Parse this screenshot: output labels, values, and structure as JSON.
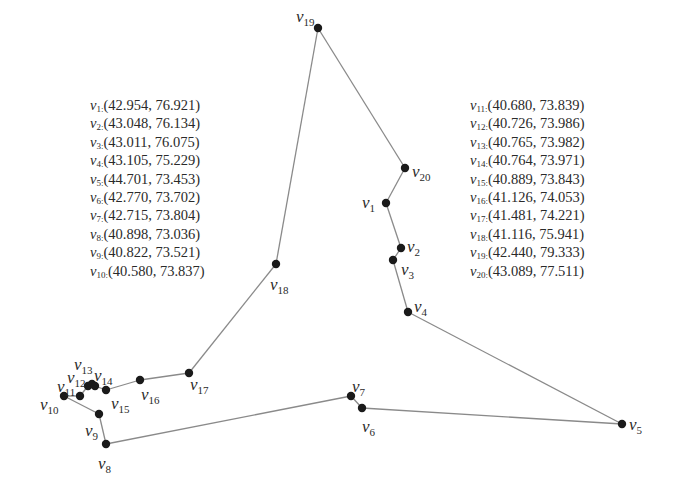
{
  "diagram": {
    "type": "tour-graph",
    "edge_color": "#8a8a8a",
    "node_color": "#1a1a1a",
    "tour_order": [
      "v1",
      "v2",
      "v3",
      "v4",
      "v5",
      "v6",
      "v7",
      "v8",
      "v9",
      "v10",
      "v11",
      "v12",
      "v13",
      "v14",
      "v15",
      "v16",
      "v17",
      "v18",
      "v19",
      "v20",
      "v1"
    ]
  },
  "nodes": [
    {
      "id": "v1",
      "name": "v",
      "sub": "1",
      "x": 386,
      "y": 203,
      "lx": 362,
      "ly": 208
    },
    {
      "id": "v2",
      "name": "v",
      "sub": "2",
      "x": 401,
      "y": 248,
      "lx": 407,
      "ly": 252
    },
    {
      "id": "v3",
      "name": "v",
      "sub": "3",
      "x": 393,
      "y": 260,
      "lx": 401,
      "ly": 275
    },
    {
      "id": "v4",
      "name": "v",
      "sub": "4",
      "x": 408,
      "y": 312,
      "lx": 414,
      "ly": 312
    },
    {
      "id": "v5",
      "name": "v",
      "sub": "5",
      "x": 622,
      "y": 424,
      "lx": 629,
      "ly": 430
    },
    {
      "id": "v6",
      "name": "v",
      "sub": "6",
      "x": 362,
      "y": 408,
      "lx": 362,
      "ly": 432
    },
    {
      "id": "v7",
      "name": "v",
      "sub": "7",
      "x": 351,
      "y": 396,
      "lx": 352,
      "ly": 392
    },
    {
      "id": "v8",
      "name": "v",
      "sub": "8",
      "x": 106,
      "y": 444,
      "lx": 98,
      "ly": 469
    },
    {
      "id": "v9",
      "name": "v",
      "sub": "9",
      "x": 99,
      "y": 414,
      "lx": 85,
      "ly": 436
    },
    {
      "id": "v10",
      "name": "v",
      "sub": "10",
      "x": 64,
      "y": 396,
      "lx": 40,
      "ly": 410
    },
    {
      "id": "v11",
      "name": "v",
      "sub": "11",
      "x": 80,
      "y": 396,
      "lx": 57,
      "ly": 392
    },
    {
      "id": "v12",
      "name": "v",
      "sub": "12",
      "x": 88,
      "y": 386,
      "lx": 67,
      "ly": 383
    },
    {
      "id": "v13",
      "name": "v",
      "sub": "13",
      "x": 92,
      "y": 384,
      "lx": 74,
      "ly": 370
    },
    {
      "id": "v14",
      "name": "v",
      "sub": "14",
      "x": 95,
      "y": 386,
      "lx": 94,
      "ly": 381
    },
    {
      "id": "v15",
      "name": "v",
      "sub": "15",
      "x": 106,
      "y": 390,
      "lx": 111,
      "ly": 409
    },
    {
      "id": "v16",
      "name": "v",
      "sub": "16",
      "x": 140,
      "y": 380,
      "lx": 141,
      "ly": 400
    },
    {
      "id": "v17",
      "name": "v",
      "sub": "17",
      "x": 189,
      "y": 373,
      "lx": 190,
      "ly": 390
    },
    {
      "id": "v18",
      "name": "v",
      "sub": "18",
      "x": 276,
      "y": 264,
      "lx": 270,
      "ly": 290
    },
    {
      "id": "v19",
      "name": "v",
      "sub": "19",
      "x": 318,
      "y": 28,
      "lx": 296,
      "ly": 22
    },
    {
      "id": "v20",
      "name": "v",
      "sub": "20",
      "x": 405,
      "y": 168,
      "lx": 412,
      "ly": 177
    }
  ],
  "coordinate_lists": {
    "left": [
      {
        "name": "v",
        "sub": "1:",
        "value": "(42.954, 76.921)"
      },
      {
        "name": "v",
        "sub": "2:",
        "value": "(43.048, 76.134)"
      },
      {
        "name": "v",
        "sub": "3:",
        "value": "(43.011, 76.075)"
      },
      {
        "name": "v",
        "sub": "4:",
        "value": "(43.105, 75.229)"
      },
      {
        "name": "v",
        "sub": "5:",
        "value": "(44.701, 73.453)"
      },
      {
        "name": "v",
        "sub": "6:",
        "value": "(42.770, 73.702)"
      },
      {
        "name": "v",
        "sub": "7:",
        "value": "(42.715, 73.804)"
      },
      {
        "name": "v",
        "sub": "8:",
        "value": "(40.898, 73.036)"
      },
      {
        "name": "v",
        "sub": "9:",
        "value": "(40.822, 73.521)"
      },
      {
        "name": "v",
        "sub": "10:",
        "value": "(40.580, 73.837)"
      }
    ],
    "right": [
      {
        "name": "v",
        "sub": "11:",
        "value": "(40.680, 73.839)"
      },
      {
        "name": "v",
        "sub": "12:",
        "value": "(40.726, 73.986)"
      },
      {
        "name": "v",
        "sub": "13:",
        "value": "(40.765, 73.982)"
      },
      {
        "name": "v",
        "sub": "14:",
        "value": "(40.764, 73.971)"
      },
      {
        "name": "v",
        "sub": "15:",
        "value": "(40.889, 73.843)"
      },
      {
        "name": "v",
        "sub": "16:",
        "value": "(41.126, 74.053)"
      },
      {
        "name": "v",
        "sub": "17:",
        "value": "(41.481, 74.221)"
      },
      {
        "name": "v",
        "sub": "18:",
        "value": "(41.116, 75.941)"
      },
      {
        "name": "v",
        "sub": "19:",
        "value": "(42.440, 79.333)"
      },
      {
        "name": "v",
        "sub": "20:",
        "value": "(43.089, 77.511)"
      }
    ]
  }
}
